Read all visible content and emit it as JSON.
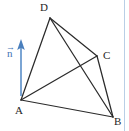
{
  "figure": {
    "background_color": "#ffffff",
    "edge_color": "#2b2b2b",
    "vector_color": "#4a7fbd",
    "border_color": "#b9cfe6",
    "label_color": "#1f1f1f"
  },
  "vertices": [
    {
      "id": "D",
      "label": "D",
      "x": 50,
      "y": 18
    },
    {
      "id": "C",
      "label": "C",
      "x": 97,
      "y": 56
    },
    {
      "id": "A",
      "label": "A",
      "x": 21,
      "y": 100
    },
    {
      "id": "B",
      "label": "B",
      "x": 113,
      "y": 117
    }
  ],
  "edges": [
    {
      "id": "DA",
      "from": "D",
      "to": "A"
    },
    {
      "id": "DB",
      "from": "D",
      "to": "B"
    },
    {
      "id": "DC",
      "from": "D",
      "to": "C"
    },
    {
      "id": "AC",
      "from": "A",
      "to": "C"
    },
    {
      "id": "AB",
      "from": "A",
      "to": "B"
    },
    {
      "id": "CB",
      "from": "C",
      "to": "B"
    }
  ],
  "vector": {
    "id": "n",
    "label": "n",
    "arrow_accent": "→",
    "origin_x": 21,
    "origin_y": 96,
    "tip_x": 21,
    "tip_y": 40,
    "direction": "up"
  }
}
